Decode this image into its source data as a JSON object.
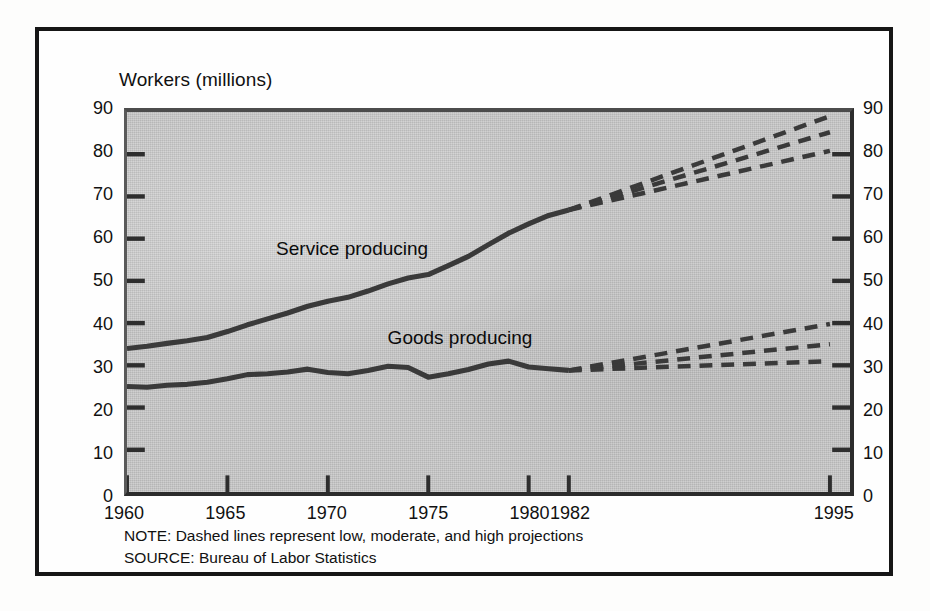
{
  "figure": {
    "title": "Workers (millions)",
    "note": "NOTE: Dashed lines represent low, moderate, and high projections",
    "source": "SOURCE: Bureau of Labor Statistics"
  },
  "chart_data": {
    "type": "line",
    "title": "Workers (millions)",
    "xlabel": "",
    "ylabel": "Workers (millions)",
    "xlim": [
      1960,
      1996
    ],
    "ylim": [
      0,
      90
    ],
    "ytick_labels": [
      "0",
      "10",
      "20",
      "30",
      "40",
      "50",
      "60",
      "70",
      "80",
      "90"
    ],
    "yticks": [
      0,
      10,
      20,
      30,
      40,
      50,
      60,
      70,
      80,
      90
    ],
    "xtick_labels": [
      "1960",
      "1965",
      "1970",
      "1975",
      "1980",
      "1982",
      "1995"
    ],
    "xticks": [
      1960,
      1965,
      1970,
      1975,
      1980,
      1982,
      1995
    ],
    "grid": false,
    "legend_position": "inline-annotation",
    "dual_y_axis": true,
    "annotations": [
      {
        "text": "Service producing",
        "x": 1967.5,
        "y": 57
      },
      {
        "text": "Goods producing",
        "x": 1973.0,
        "y": 36.5
      }
    ],
    "series": [
      {
        "name": "Service producing",
        "style": "solid",
        "x": [
          1960,
          1961,
          1962,
          1963,
          1964,
          1965,
          1966,
          1967,
          1968,
          1969,
          1970,
          1971,
          1972,
          1973,
          1974,
          1975,
          1976,
          1977,
          1978,
          1979,
          1980,
          1981,
          1982
        ],
        "values": [
          34.0,
          34.5,
          35.2,
          35.8,
          36.6,
          38.0,
          39.6,
          41.0,
          42.4,
          44.0,
          45.2,
          46.1,
          47.6,
          49.3,
          50.7,
          51.5,
          53.6,
          55.8,
          58.6,
          61.3,
          63.5,
          65.5,
          66.8
        ]
      },
      {
        "name": "Goods producing",
        "style": "solid",
        "x": [
          1960,
          1961,
          1962,
          1963,
          1964,
          1965,
          1966,
          1967,
          1968,
          1969,
          1970,
          1971,
          1972,
          1973,
          1974,
          1975,
          1976,
          1977,
          1978,
          1979,
          1980,
          1981,
          1982
        ],
        "values": [
          25.0,
          24.8,
          25.3,
          25.5,
          26.0,
          26.8,
          27.8,
          28.0,
          28.4,
          29.1,
          28.3,
          28.0,
          28.8,
          29.8,
          29.5,
          27.2,
          28.0,
          29.0,
          30.3,
          31.0,
          29.6,
          29.2,
          28.8
        ]
      },
      {
        "name": "Service producing high projection",
        "style": "dashed",
        "x": [
          1982,
          1995
        ],
        "values": [
          66.8,
          89.0
        ]
      },
      {
        "name": "Service producing moderate projection",
        "style": "dashed",
        "x": [
          1982,
          1995
        ],
        "values": [
          66.8,
          85.2
        ]
      },
      {
        "name": "Service producing low projection",
        "style": "dashed",
        "x": [
          1982,
          1995
        ],
        "values": [
          66.8,
          80.8
        ]
      },
      {
        "name": "Goods producing high projection",
        "style": "dashed",
        "x": [
          1982,
          1995
        ],
        "values": [
          28.8,
          39.8
        ]
      },
      {
        "name": "Goods producing moderate projection",
        "style": "dashed",
        "x": [
          1982,
          1995
        ],
        "values": [
          28.8,
          35.0
        ]
      },
      {
        "name": "Goods producing low projection",
        "style": "dashed",
        "x": [
          1982,
          1995
        ],
        "values": [
          28.8,
          31.0
        ]
      }
    ]
  }
}
